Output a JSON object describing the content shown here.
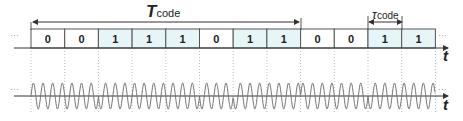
{
  "diagram": {
    "bits": [
      "0",
      "0",
      "1",
      "1",
      "1",
      "0",
      "1",
      "1",
      "0",
      "0",
      "1",
      "1"
    ],
    "colors": {
      "zero_fill": "#ffffff",
      "one_fill": "#e6f6f8",
      "border": "#555555",
      "wave": "#777777",
      "axis": "#333333"
    },
    "T_code_label": {
      "main": "T",
      "sub": "code"
    },
    "tau_code_label": {
      "main": "τ",
      "sub": "code"
    },
    "axis_label_top": "t",
    "axis_label_bottom": "t",
    "ellipsis": "···"
  }
}
